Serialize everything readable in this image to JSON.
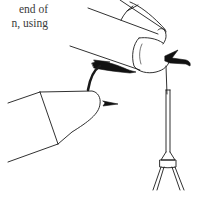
{
  "document": {
    "text_lines": [
      "end of",
      "n, using"
    ]
  },
  "illustration": {
    "description": "Line drawing of fly tying: thumb and finger pinching a fly on a hook held in a vise, with a bobbin hanging below",
    "parts": [
      "upper-fingers",
      "thumb-tip",
      "fly-wing",
      "hook-bend",
      "left-hand-fingertip",
      "hook-point",
      "bobbin-tube",
      "bobbin-collar",
      "bobbin-legs"
    ],
    "stroke_color": "#1a1a1a",
    "background_color": "#ffffff"
  }
}
